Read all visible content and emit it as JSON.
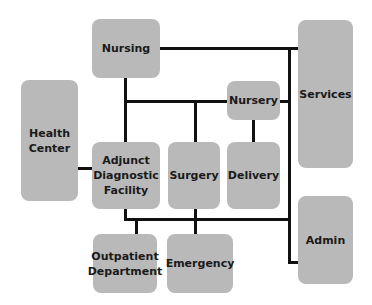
{
  "diagram": {
    "type": "block-diagram",
    "colors": {
      "box_fill": "#b9b9b9",
      "line": "#111111",
      "text": "#1a1a1a",
      "background": "#ffffff"
    },
    "nodes": [
      {
        "id": "nursing",
        "label": "Nursing"
      },
      {
        "id": "services",
        "label": "Services"
      },
      {
        "id": "health_center",
        "label": "Health\nCenter"
      },
      {
        "id": "nursery",
        "label": "Nursery"
      },
      {
        "id": "adjunct",
        "label": "Adjunct\nDiagnostic\nFacility"
      },
      {
        "id": "surgery",
        "label": "Surgery"
      },
      {
        "id": "delivery",
        "label": "Delivery"
      },
      {
        "id": "admin",
        "label": "Admin"
      },
      {
        "id": "outpatient",
        "label": "Outpatient\nDepartment"
      },
      {
        "id": "emergency",
        "label": "Emergency"
      }
    ],
    "edges": [
      [
        "nursing",
        "services"
      ],
      [
        "nursing",
        "adjunct"
      ],
      [
        "nursing",
        "surgery"
      ],
      [
        "nursing",
        "nursery"
      ],
      [
        "nursery",
        "delivery"
      ],
      [
        "nursery",
        "services"
      ],
      [
        "health_center",
        "adjunct"
      ],
      [
        "adjunct",
        "outpatient"
      ],
      [
        "adjunct",
        "surgery"
      ],
      [
        "surgery",
        "emergency"
      ],
      [
        "services",
        "admin"
      ]
    ]
  }
}
